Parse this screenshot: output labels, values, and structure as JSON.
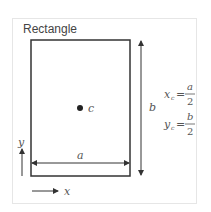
{
  "title": "Rectangle",
  "labels": {
    "centroid": "c",
    "width": "a",
    "height": "b",
    "x_axis": "x",
    "y_axis": "y"
  },
  "formulas": [
    {
      "lhs": "x",
      "sub": "c",
      "num": "a",
      "den": "2"
    },
    {
      "lhs": "y",
      "sub": "c",
      "num": "b",
      "den": "2"
    }
  ]
}
